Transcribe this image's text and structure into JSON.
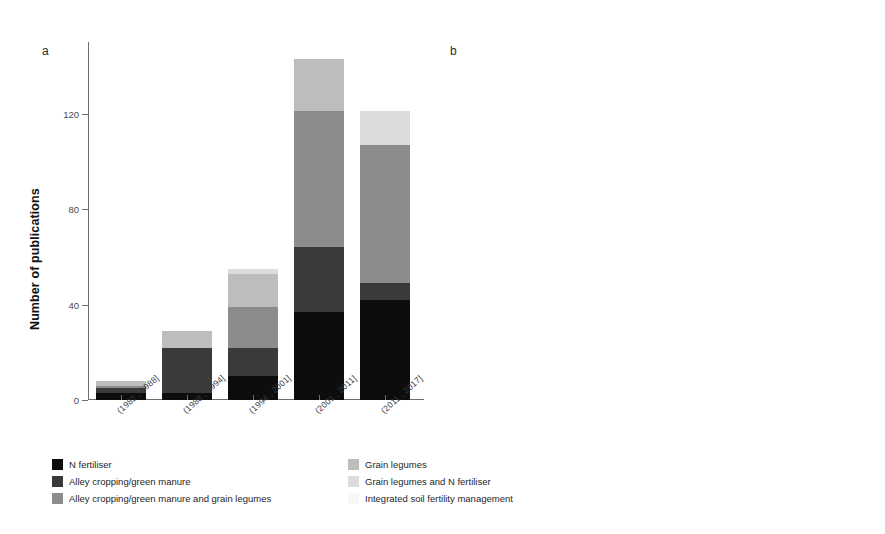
{
  "figure": {
    "panel_a_letter": "a",
    "panel_b_letter": "b"
  },
  "chart_data": [
    {
      "type": "bar",
      "panel": "a",
      "title": "",
      "xlabel": "",
      "ylabel": "Number of publications",
      "ylim": [
        0,
        150
      ],
      "yticks": [
        0,
        40,
        80,
        120
      ],
      "ytick_labels": [
        "0",
        "40",
        "80",
        "120"
      ],
      "grid": false,
      "stacked": true,
      "legend_position": "below",
      "categories": [
        "(1982 , 1988]",
        "(1988 , 1994]",
        "(1994 , 2001]",
        "(2001 , 2011]",
        "(2011 , 2017]"
      ],
      "series": [
        {
          "name": "N fertiliser",
          "color": "#0d0d0d",
          "values": [
            3,
            3,
            10,
            37,
            42
          ]
        },
        {
          "name": "Alley cropping/green manure",
          "color": "#3a3a3a",
          "values": [
            2,
            19,
            12,
            27,
            7
          ]
        },
        {
          "name": "Alley cropping/green manure and grain legumes",
          "color": "#8c8c8c",
          "values": [
            1,
            0,
            17,
            57,
            58
          ]
        },
        {
          "name": "Grain legumes",
          "color": "#bdbdbd",
          "values": [
            2,
            7,
            14,
            22,
            0
          ]
        },
        {
          "name": "Grain legumes and N fertiliser",
          "color": "#dcdcdc",
          "values": [
            0,
            0,
            2,
            0,
            14
          ]
        },
        {
          "name": "Integrated soil fertility management",
          "color": "#f2f2f2",
          "values": [
            0,
            0,
            0,
            0,
            0
          ]
        }
      ],
      "totals": [
        8,
        29,
        55,
        143,
        121
      ]
    },
    {
      "type": "bar",
      "panel": "b",
      "title": "",
      "xlabel": "",
      "ylabel": "Proportion of publications (%)",
      "ylim": [
        0,
        100
      ],
      "yticks": [
        0,
        25,
        50,
        75,
        100
      ],
      "ytick_labels": [
        "0",
        "25",
        "50",
        "75",
        "100"
      ],
      "grid": false,
      "stacked": true,
      "legend_position": "below",
      "categories": [
        "(1982 , 1988]",
        "(1988 , 1994]",
        "(1994 , 2001]",
        "(2001 , 2011]",
        "(2011 , 2017]"
      ],
      "series": [
        {
          "name": "N fertiliser",
          "color": "#0d0d0d",
          "values": [
            37.5,
            15.0,
            19.0,
            23.0,
            34.0
          ]
        },
        {
          "name": "Alley cropping/green manure",
          "color": "#3a3a3a",
          "values": [
            37.5,
            66.0,
            21.0,
            18.0,
            5.0
          ]
        },
        {
          "name": "Alley cropping/green manure and grain legumes",
          "color": "#8c8c8c",
          "values": [
            0.0,
            0.0,
            28.0,
            11.0,
            6.0
          ]
        },
        {
          "name": "Grain legumes",
          "color": "#bdbdbd",
          "values": [
            25.0,
            0.0,
            26.0,
            37.0,
            37.0
          ]
        },
        {
          "name": "Grain legumes and N fertiliser",
          "color": "#dcdcdc",
          "values": [
            0.0,
            19.0,
            6.0,
            11.0,
            18.0
          ]
        },
        {
          "name": "Integrated soil fertility management",
          "color": "#f2f2f2",
          "values": [
            0.0,
            0.0,
            0.0,
            0.0,
            0.0
          ]
        }
      ],
      "totals": [
        100,
        100,
        100,
        100,
        100
      ]
    }
  ],
  "legend": {
    "left_column": [
      {
        "label": "N fertiliser",
        "color": "#0d0d0d"
      },
      {
        "label": "Alley cropping/green manure",
        "color": "#3a3a3a"
      },
      {
        "label": "Alley cropping/green manure and grain legumes",
        "color": "#8c8c8c"
      }
    ],
    "right_column": [
      {
        "label": "Grain legumes",
        "color": "#bdbdbd"
      },
      {
        "label": "Grain legumes and N fertiliser",
        "color": "#dcdcdc"
      },
      {
        "label": "Integrated soil fertility management",
        "color": "#f7f7f7"
      }
    ]
  }
}
